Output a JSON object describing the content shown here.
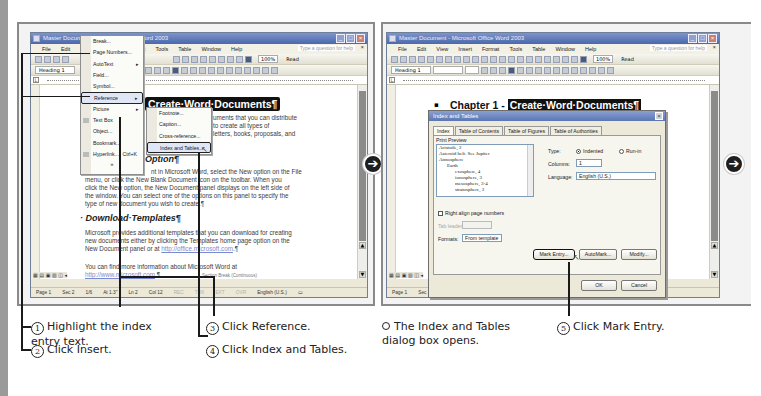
{
  "window": {
    "title": "Master Document - Microsoft Office Word 2003",
    "menu": [
      "File",
      "Edit",
      "View",
      "Insert",
      "Format",
      "Tools",
      "Table",
      "Window",
      "Help"
    ],
    "help_placeholder": "Type a question for help",
    "zoom": "100%",
    "read_label": "Read",
    "style": "Heading 1",
    "status": {
      "page": "Page 1",
      "sec": "Sec 2",
      "pages": "1/6",
      "at": "At 1.3\"",
      "ln": "Ln 2",
      "col": "Col 12",
      "rec": "REC",
      "trk": "TRK",
      "ext": "EXT",
      "ovr": "OVR",
      "lang": "English (U.S.)"
    }
  },
  "left_panel": {
    "insert_menu": {
      "items": [
        {
          "label": "Break..."
        },
        {
          "label": "Page Numbers..."
        },
        {
          "label": "AutoText",
          "submenu": true
        },
        {
          "label": "Field..."
        },
        {
          "label": "Symbol..."
        },
        {
          "label": "Reference",
          "submenu": true,
          "highlighted": true
        },
        {
          "label": "Picture",
          "submenu": true
        },
        {
          "label": "Text Box"
        },
        {
          "label": "Object..."
        },
        {
          "label": "Bookmark..."
        },
        {
          "label": "Hyperlink...",
          "shortcut": "Ctrl+K"
        }
      ],
      "expand": "»"
    },
    "reference_submenu": {
      "items": [
        {
          "label": "Footnote..."
        },
        {
          "label": "Caption..."
        },
        {
          "label": "Cross-reference..."
        },
        {
          "label": "Index and Tables...",
          "highlighted": true
        }
      ]
    },
    "doc": {
      "heading": "Create·Word·Documents¶",
      "intro_lines": [
        "uments that you can distribute",
        "to create all types of",
        "letters, books, proposals, and"
      ],
      "subheading1": "Option¶",
      "para1": [
        "nt in Microsoft Word, select the New option on the File",
        "menu, or click the New Blank Document icon on the toolbar.  When you",
        "click the New option, the New Document panel displays on the left side of",
        "the window. You can select one of the options on this panel to specify the",
        "type of new document you wish to create.¶"
      ],
      "subheading2": "Download·Templates¶",
      "para2": [
        "Microsoft provides additional templates that you can download for creating",
        "new documents either by clicking the Templates home page option on the",
        "New Document panel or at "
      ],
      "para2_link": "http://office.microsoft.com",
      "para2_end": ".¶",
      "para3": "You can find more information about Microsoft Word at",
      "para3_link": "http://www.microsoft.com",
      "para3_end": ".¶",
      "section_break": "Section Break (Continuous)"
    }
  },
  "right_panel": {
    "doc": {
      "chapter_prefix": "Chapter 1 - ",
      "chapter_title": "Create·Word·Documents¶"
    },
    "dialog": {
      "title": "Index and Tables",
      "tabs": [
        "Index",
        "Table of Contents",
        "Table of Figures",
        "Table of Authorities"
      ],
      "print_preview_label": "Print Preview",
      "preview_lines": [
        "Aristotle, 2",
        "Asteroid belt. See Jupiter",
        "Atmosphere",
        "Earth",
        "exosphere, 4",
        "ionosphere, 3",
        "mesosphere, 3-4",
        "stratosphere, 3"
      ],
      "type_label": "Type:",
      "type_indented": "Indented",
      "type_runin": "Run-in",
      "columns_label": "Columns:",
      "columns_value": "1",
      "language_label": "Language:",
      "language_value": "English (U.S.)",
      "right_align_label": "Right align page numbers",
      "tab_leader_label": "Tab leader:",
      "formats_label": "Formats:",
      "formats_value": "From template",
      "buttons": {
        "mark_entry": "Mark Entry...",
        "automark": "AutoMark...",
        "modify": "Modify...",
        "ok": "OK",
        "cancel": "Cancel"
      }
    }
  },
  "captions": {
    "step1": {
      "num": "1",
      "text": "Highlight the index entry text."
    },
    "step2": {
      "num": "2",
      "text": "Click Insert."
    },
    "step3": {
      "num": "3",
      "text": "Click Reference."
    },
    "step4": {
      "num": "4",
      "text": "Click Index and Tables."
    },
    "note": {
      "text": "The Index and Tables dialog box opens."
    },
    "step5": {
      "num": "5",
      "text": "Click Mark Entry."
    }
  },
  "colors": {
    "titlebar": "#5a76b6",
    "callout": "#1a1a1a",
    "next_arrow": "#1e1e1e"
  }
}
